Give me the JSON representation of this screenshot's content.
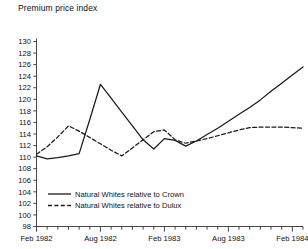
{
  "chart_data": {
    "type": "line",
    "title": "Premium price index",
    "ylabel": "Premium price index",
    "xlabel": "",
    "ylim": [
      98,
      130
    ],
    "ytick_step": 2,
    "yticks": [
      98,
      100,
      102,
      104,
      106,
      108,
      110,
      112,
      114,
      116,
      118,
      120,
      122,
      124,
      126,
      128,
      130
    ],
    "xticks_labeled": [
      "Feb 1982",
      "Aug 1982",
      "Feb 1983",
      "Aug 1983",
      "Feb 1984"
    ],
    "x_tick_interval": "monthly",
    "x_label_interval_months": 6,
    "grid": false,
    "legend_position": "inside-bottom-left",
    "series": [
      {
        "name": "Natural Whites relative to Crown",
        "style": "solid",
        "color": "#1a1a1a",
        "x": [
          "Feb 1982",
          "Mar 1982",
          "Apr 1982",
          "May 1982",
          "Jun 1982",
          "Jul 1982",
          "Aug 1982",
          "Sep 1982",
          "Oct 1982",
          "Nov 1982",
          "Dec 1982",
          "Jan 1983",
          "Feb 1983",
          "Mar 1983",
          "Apr 1983",
          "May 1983",
          "Jun 1983",
          "Jul 1983",
          "Aug 1983",
          "Sep 1983",
          "Oct 1983",
          "Nov 1983",
          "Dec 1983",
          "Jan 1984",
          "Feb 1984",
          "Mar 1984"
        ],
        "values": [
          110.2,
          109.7,
          109.9,
          110.2,
          110.6,
          116.5,
          122.6,
          120.2,
          117.8,
          115.4,
          113.0,
          111.4,
          113.2,
          112.9,
          111.9,
          112.8,
          113.9,
          115.0,
          116.2,
          117.4,
          118.6,
          119.9,
          121.4,
          122.8,
          124.2,
          125.6
        ]
      },
      {
        "name": "Natural Whites relative to Dulux",
        "style": "dashed",
        "color": "#1a1a1a",
        "x": [
          "Feb 1982",
          "Mar 1982",
          "Apr 1982",
          "May 1982",
          "Jun 1982",
          "Jul 1982",
          "Aug 1982",
          "Sep 1982",
          "Oct 1982",
          "Nov 1982",
          "Dec 1982",
          "Jan 1983",
          "Feb 1983",
          "Mar 1983",
          "Apr 1983",
          "May 1983",
          "Jun 1983",
          "Jul 1983",
          "Aug 1983",
          "Sep 1983",
          "Oct 1983",
          "Nov 1983",
          "Dec 1983",
          "Jan 1984",
          "Feb 1984",
          "Mar 1984"
        ],
        "values": [
          110.5,
          111.8,
          113.5,
          115.4,
          114.5,
          113.4,
          112.3,
          111.2,
          110.2,
          111.6,
          113.0,
          114.4,
          114.7,
          113.0,
          112.4,
          112.8,
          113.2,
          113.7,
          114.2,
          114.7,
          115.1,
          115.2,
          115.2,
          115.2,
          115.1,
          115.0
        ]
      }
    ]
  },
  "legend": {
    "entries": [
      {
        "label": "Natural Whites relative to Crown",
        "style": "solid"
      },
      {
        "label": "Natural Whites relative to Dulux",
        "style": "dashed"
      }
    ]
  }
}
